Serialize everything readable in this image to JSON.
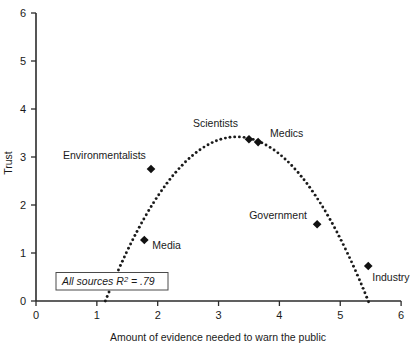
{
  "chart_data": {
    "type": "scatter",
    "title": "",
    "xlabel": "Amount of evidence needed to warn the public",
    "ylabel": "Trust",
    "xlim": [
      0,
      6
    ],
    "ylim": [
      0,
      6
    ],
    "xticks": [
      "0",
      "1",
      "2",
      "3",
      "4",
      "5",
      "6"
    ],
    "yticks": [
      "0",
      "1",
      "2",
      "3",
      "4",
      "5",
      "6"
    ],
    "grid": false,
    "legend": "none",
    "points": [
      {
        "label": "Environmentalists",
        "x": 1.89,
        "y": 2.75,
        "label_dx": -88,
        "label_dy": -10
      },
      {
        "label": "Media",
        "x": 1.78,
        "y": 1.27,
        "label_dx": 8,
        "label_dy": 9
      },
      {
        "label": "Scientists",
        "x": 3.5,
        "y": 3.37,
        "label_dx": -56,
        "label_dy": -12
      },
      {
        "label": "Medics",
        "x": 3.65,
        "y": 3.31,
        "label_dx": 12,
        "label_dy": -5
      },
      {
        "label": "Government",
        "x": 4.62,
        "y": 1.6,
        "label_dx": -68,
        "label_dy": -5
      },
      {
        "label": "Industry",
        "x": 5.46,
        "y": 0.73,
        "label_dx": 4,
        "label_dy": 15
      }
    ],
    "fit_curve": {
      "type": "quadratic",
      "style": "dotted",
      "vertex_x": 3.3,
      "vertex_y": 3.42,
      "x_start": 1.14,
      "x_end": 5.47
    },
    "annotation": {
      "text_italic_prefix": "All sources ",
      "r_symbol": "R",
      "superscript": "2",
      "equals_value": " = .79",
      "full_text": "All sources R2 = .79"
    }
  },
  "axis_color": "#2b2b2b",
  "marker_color": "#111111",
  "background": "#ffffff"
}
